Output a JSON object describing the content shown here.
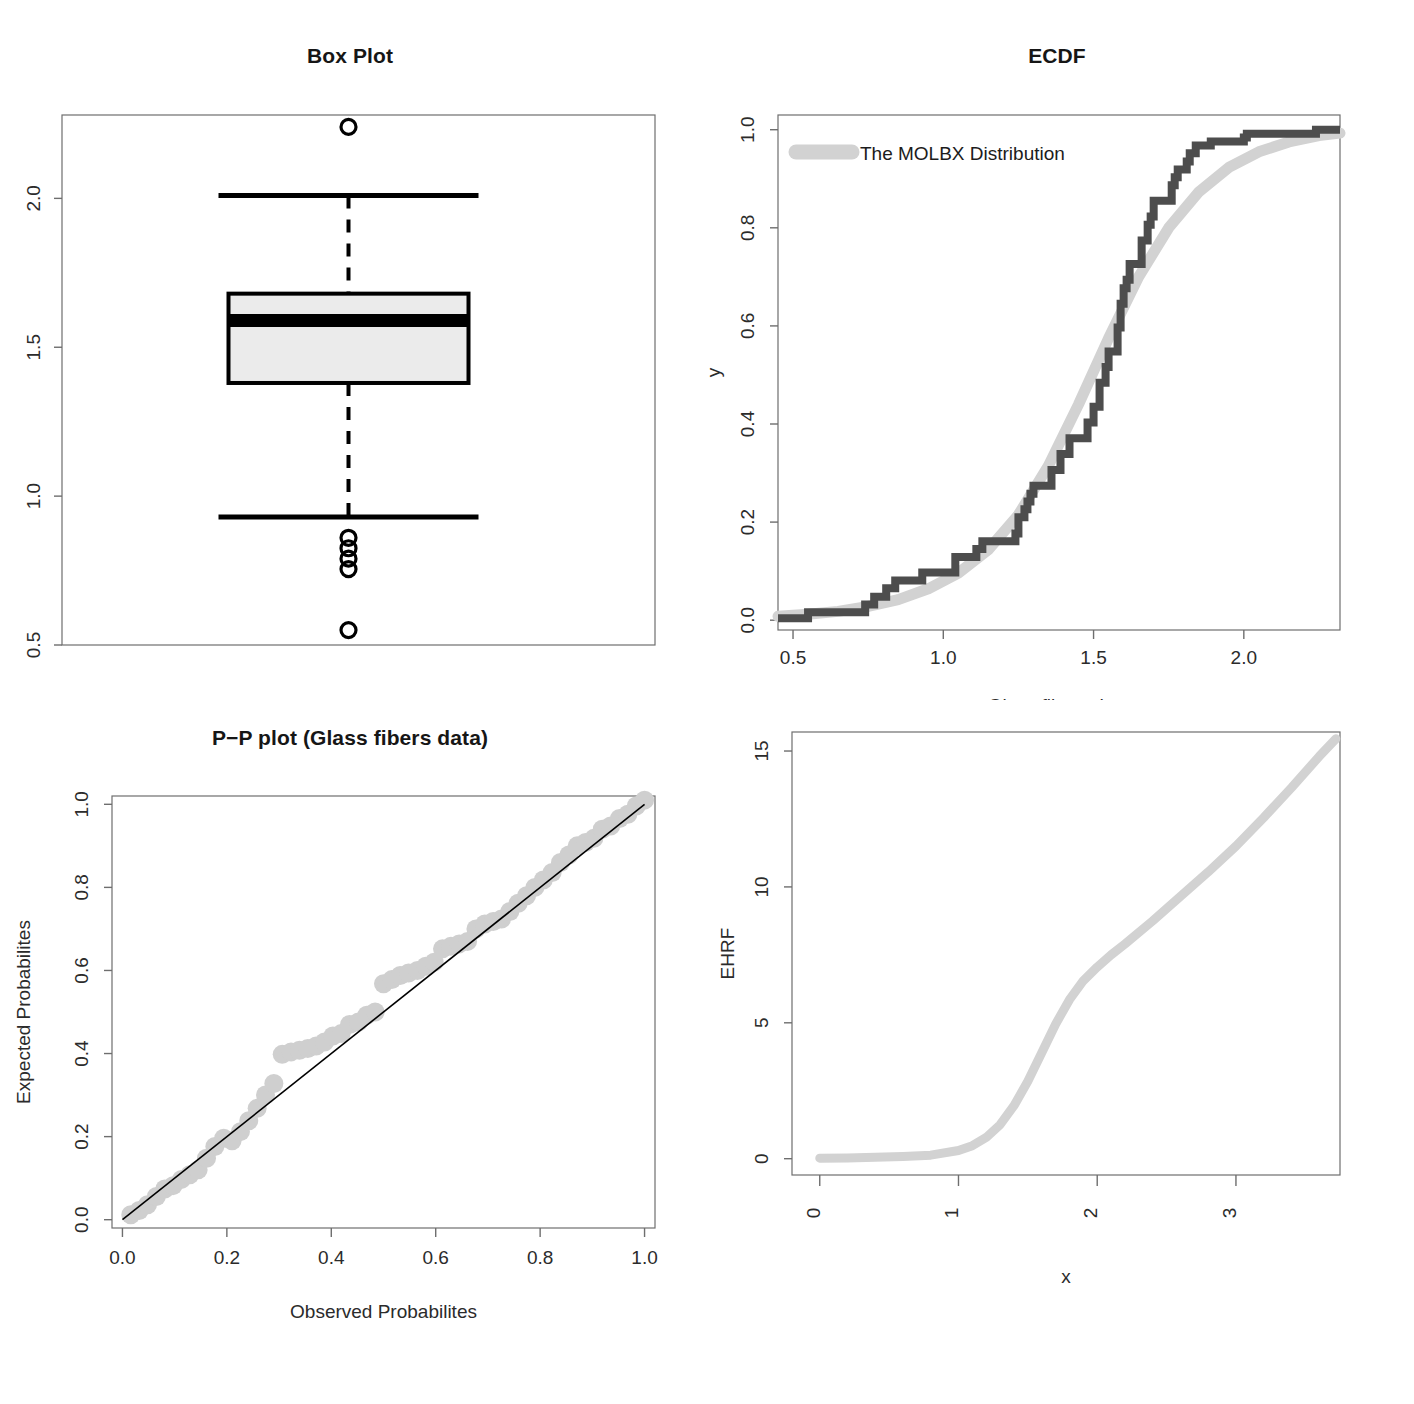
{
  "figure": {
    "background": "#ffffff",
    "panel_count": 4
  },
  "colors": {
    "axis": "#6e6e6e",
    "text": "#2b2b2b",
    "title": "#161616",
    "ecdf_empirical": "#4d4d4d",
    "fitted_light_gray": "#d2d2d2",
    "box_fill": "#ebebeb",
    "box_border": "#000000",
    "pp_point": "#cfcfcf",
    "pp_line": "#000000"
  },
  "chart_data": [
    {
      "id": "box-plot",
      "type": "box",
      "title": "Box Plot",
      "xlabel": "",
      "ylabel": "",
      "ylim": [
        0.5,
        2.28
      ],
      "yticks": [
        "0.5",
        "1.0",
        "1.5",
        "2.0"
      ],
      "ytick_values": [
        0.5,
        1.0,
        1.5,
        2.0
      ],
      "grid": false,
      "box": {
        "min_whisker": 0.93,
        "q1": 1.38,
        "median": 1.59,
        "q3": 1.68,
        "max_whisker": 2.01
      },
      "outliers": [
        2.24,
        0.86,
        0.825,
        0.79,
        0.755,
        0.55
      ]
    },
    {
      "id": "ecdf",
      "type": "line",
      "title": "ECDF",
      "xlabel": "Glass fibers data",
      "ylabel": "y",
      "xlim": [
        0.45,
        2.32
      ],
      "ylim": [
        -0.02,
        1.03
      ],
      "xticks": [
        "0.5",
        "1.0",
        "1.5",
        "2.0"
      ],
      "xtick_values": [
        0.5,
        1.0,
        1.5,
        2.0
      ],
      "yticks": [
        "0.0",
        "0.2",
        "0.4",
        "0.6",
        "0.8",
        "1.0"
      ],
      "ytick_values": [
        0.0,
        0.2,
        0.4,
        0.6,
        0.8,
        1.0
      ],
      "grid": false,
      "legend": {
        "position": "top-left",
        "entries": [
          {
            "label": "The MOLBX Distribution",
            "color": "#d2d2d2",
            "style": "line"
          }
        ]
      },
      "series": [
        {
          "name": "Empirical CDF",
          "style": "step",
          "color": "#4d4d4d",
          "x": [
            0.55,
            0.74,
            0.77,
            0.81,
            0.84,
            0.93,
            1.04,
            1.11,
            1.13,
            1.24,
            1.25,
            1.27,
            1.28,
            1.29,
            1.3,
            1.36,
            1.39,
            1.42,
            1.48,
            1.5,
            1.52,
            1.54,
            1.55,
            1.58,
            1.59,
            1.6,
            1.61,
            1.62,
            1.66,
            1.68,
            1.69,
            1.7,
            1.76,
            1.77,
            1.78,
            1.81,
            1.82,
            1.84,
            1.89,
            2.0,
            2.01,
            2.24
          ],
          "y": [
            0.016,
            0.032,
            0.048,
            0.065,
            0.081,
            0.097,
            0.129,
            0.145,
            0.161,
            0.177,
            0.21,
            0.226,
            0.242,
            0.258,
            0.274,
            0.306,
            0.339,
            0.371,
            0.403,
            0.435,
            0.484,
            0.516,
            0.548,
            0.597,
            0.645,
            0.677,
            0.694,
            0.726,
            0.774,
            0.806,
            0.823,
            0.855,
            0.887,
            0.903,
            0.919,
            0.935,
            0.952,
            0.968,
            0.976,
            0.984,
            0.992,
            1.0
          ]
        },
        {
          "name": "The MOLBX Distribution",
          "style": "smooth",
          "color": "#d2d2d2",
          "x": [
            0.45,
            0.55,
            0.65,
            0.75,
            0.85,
            0.95,
            1.05,
            1.15,
            1.25,
            1.35,
            1.45,
            1.55,
            1.65,
            1.75,
            1.85,
            1.95,
            2.05,
            2.15,
            2.25,
            2.32
          ],
          "y": [
            0.008,
            0.012,
            0.018,
            0.028,
            0.042,
            0.064,
            0.096,
            0.144,
            0.215,
            0.315,
            0.44,
            0.575,
            0.7,
            0.8,
            0.873,
            0.923,
            0.955,
            0.975,
            0.988,
            0.993
          ]
        }
      ]
    },
    {
      "id": "pp-plot",
      "type": "scatter",
      "title": "P−P plot (Glass fibers data)",
      "xlabel": "Observed Probabilites",
      "ylabel": "Expected Probabilites",
      "xlim": [
        -0.02,
        1.02
      ],
      "ylim": [
        -0.02,
        1.02
      ],
      "xticks": [
        "0.0",
        "0.2",
        "0.4",
        "0.6",
        "0.8",
        "1.0"
      ],
      "xtick_values": [
        0.0,
        0.2,
        0.4,
        0.6,
        0.8,
        1.0
      ],
      "yticks": [
        "0.0",
        "0.2",
        "0.4",
        "0.6",
        "0.8",
        "1.0"
      ],
      "ytick_values": [
        0.0,
        0.2,
        0.4,
        0.6,
        0.8,
        1.0
      ],
      "grid": false,
      "reference_line": {
        "slope": 1,
        "intercept": 0,
        "color": "#000000"
      },
      "points": {
        "color": "#cfcfcf",
        "x": [
          0.016,
          0.032,
          0.048,
          0.065,
          0.081,
          0.097,
          0.113,
          0.129,
          0.145,
          0.161,
          0.177,
          0.194,
          0.21,
          0.226,
          0.242,
          0.258,
          0.274,
          0.29,
          0.306,
          0.323,
          0.339,
          0.355,
          0.371,
          0.387,
          0.403,
          0.419,
          0.435,
          0.452,
          0.468,
          0.484,
          0.5,
          0.516,
          0.532,
          0.548,
          0.565,
          0.581,
          0.597,
          0.613,
          0.629,
          0.645,
          0.661,
          0.677,
          0.694,
          0.71,
          0.726,
          0.742,
          0.758,
          0.774,
          0.79,
          0.806,
          0.823,
          0.839,
          0.855,
          0.871,
          0.887,
          0.903,
          0.919,
          0.935,
          0.952,
          0.968,
          0.984,
          1.0
        ],
        "y": [
          0.012,
          0.022,
          0.036,
          0.056,
          0.074,
          0.082,
          0.097,
          0.108,
          0.12,
          0.148,
          0.176,
          0.196,
          0.19,
          0.212,
          0.238,
          0.268,
          0.3,
          0.328,
          0.398,
          0.404,
          0.408,
          0.412,
          0.418,
          0.428,
          0.442,
          0.448,
          0.47,
          0.476,
          0.492,
          0.5,
          0.568,
          0.578,
          0.588,
          0.594,
          0.6,
          0.61,
          0.62,
          0.652,
          0.658,
          0.664,
          0.67,
          0.7,
          0.712,
          0.718,
          0.724,
          0.742,
          0.762,
          0.78,
          0.8,
          0.818,
          0.836,
          0.86,
          0.878,
          0.9,
          0.908,
          0.918,
          0.94,
          0.948,
          0.966,
          0.976,
          0.996,
          1.01
        ]
      }
    },
    {
      "id": "ehrf-plot",
      "type": "line",
      "title": "",
      "xlabel": "x",
      "ylabel": "EHRF",
      "xlim": [
        -0.2,
        3.75
      ],
      "ylim": [
        -0.6,
        15.7
      ],
      "xticks": [
        "0",
        "1",
        "2",
        "3"
      ],
      "xtick_values": [
        0,
        1,
        2,
        3
      ],
      "yticks": [
        "0",
        "5",
        "10",
        "15"
      ],
      "ytick_values": [
        0,
        5,
        10,
        15
      ],
      "grid": false,
      "series": [
        {
          "name": "EHRF",
          "style": "smooth",
          "color": "#d2d2d2",
          "x": [
            0.0,
            0.2,
            0.4,
            0.6,
            0.8,
            1.0,
            1.1,
            1.2,
            1.3,
            1.4,
            1.5,
            1.6,
            1.7,
            1.8,
            1.9,
            2.0,
            2.1,
            2.2,
            2.4,
            2.6,
            2.8,
            3.0,
            3.2,
            3.4,
            3.6,
            3.72
          ],
          "y": [
            0.02,
            0.03,
            0.05,
            0.08,
            0.13,
            0.3,
            0.48,
            0.78,
            1.25,
            1.95,
            2.85,
            3.9,
            4.95,
            5.85,
            6.55,
            7.05,
            7.5,
            7.9,
            8.75,
            9.65,
            10.55,
            11.5,
            12.55,
            13.65,
            14.8,
            15.45
          ]
        }
      ]
    }
  ]
}
